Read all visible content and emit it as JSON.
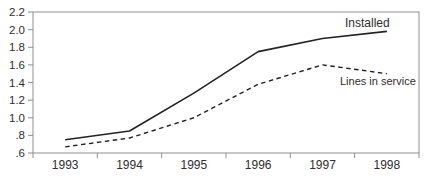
{
  "chart_data": {
    "type": "line",
    "title": "",
    "xlabel": "",
    "ylabel": "",
    "categories": [
      "1993",
      "1994",
      "1995",
      "1996",
      "1997",
      "1998"
    ],
    "series": [
      {
        "name": "Installed",
        "style": "solid",
        "values": [
          0.75,
          0.85,
          1.28,
          1.75,
          1.9,
          1.98
        ]
      },
      {
        "name": "Lines in service",
        "style": "dashed",
        "values": [
          0.67,
          0.77,
          1.0,
          1.38,
          1.6,
          1.5
        ]
      }
    ],
    "ylim": [
      0.6,
      2.2
    ],
    "ytick_step": 0.2,
    "ytick_labels": [
      "2.2",
      "2.0",
      "1.8",
      "1.6",
      "1.4",
      "1.2",
      "1.0",
      ".8",
      ".6"
    ],
    "grid": false,
    "legend": "inline-labels",
    "frame": true,
    "x_ticks_between_categories": true
  },
  "colors": {
    "background": "#ffffff",
    "frame": "#8f8f8f",
    "data_line": "#222222",
    "text": "#2e2e2e"
  }
}
